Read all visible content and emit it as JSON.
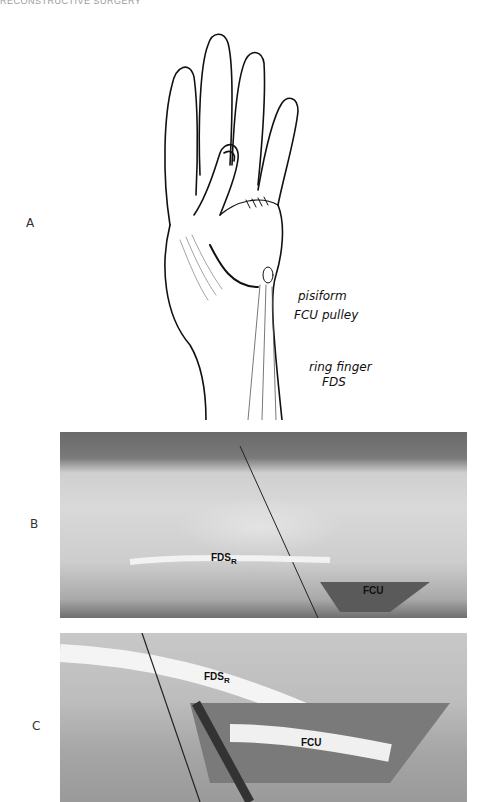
{
  "header": {
    "text": "RECONSTRUCTIVE SURGERY"
  },
  "figure": {
    "panels": [
      {
        "id": "A",
        "label": "A",
        "type": "illustration",
        "annotations": [
          "pisiform",
          "FCU pulley",
          "ring finger",
          "FDS"
        ]
      },
      {
        "id": "B",
        "label": "B",
        "type": "photograph",
        "annotations": [
          {
            "main": "FDS",
            "sub": "R"
          },
          {
            "main": "FCU"
          }
        ]
      },
      {
        "id": "C",
        "label": "C",
        "type": "photograph",
        "annotations": [
          {
            "main": "FDS",
            "sub": "R"
          },
          {
            "main": "FCU"
          }
        ]
      }
    ]
  },
  "colors": {
    "background": "#ffffff",
    "ink": "#111111",
    "photo_gray": "#bdbdbd"
  }
}
